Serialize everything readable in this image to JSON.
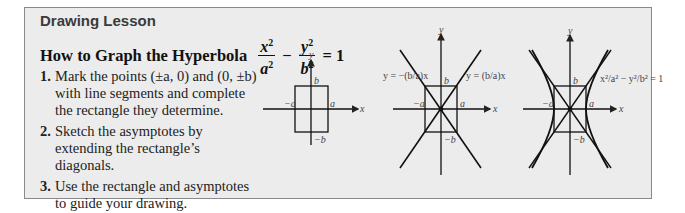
{
  "lesson": {
    "kicker": "Drawing Lesson",
    "title_prefix": "How to Graph the Hyperbola",
    "equation": {
      "term1_num": "x",
      "term1_den": "a",
      "term2_num": "y",
      "term2_den": "b",
      "exponent": "2",
      "minus": "−",
      "equals": "= 1"
    },
    "steps": [
      {
        "number": "1.",
        "text": "Mark the points (±a, 0) and (0, ±b) with line segments and complete the rectangle they determine."
      },
      {
        "number": "2.",
        "text": "Sketch the asymptotes by extending the rectangle’s diagonals."
      },
      {
        "number": "3.",
        "text": "Use the rectangle and asymptotes to guide your drawing."
      }
    ]
  },
  "figures": {
    "axis_x": "x",
    "axis_y": "y",
    "label_b": "b",
    "label_neg_b": "−b",
    "label_a": "a",
    "label_neg_a": "−a",
    "asymptote_neg": "y = −(b/a)x",
    "asymptote_pos": "y = (b/a)x",
    "hyperbola_eq": "x²/a² − y²/b² = 1"
  },
  "colors": {
    "panel_bg": "#ececec",
    "panel_border": "#8a8a8a",
    "kicker": "#3a3a3a",
    "lines": "#111111"
  }
}
